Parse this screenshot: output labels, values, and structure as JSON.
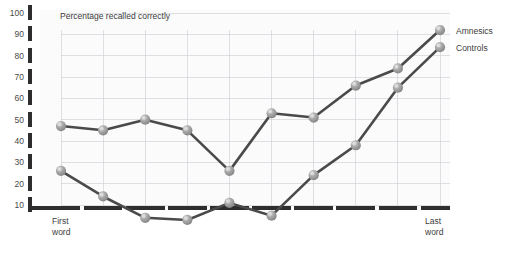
{
  "chart_data": {
    "type": "line",
    "title": "Percentage recalled correctly",
    "xlabel": "",
    "ylabel": "",
    "ylim": [
      0,
      100
    ],
    "yticks": [
      10,
      20,
      30,
      40,
      50,
      60,
      70,
      80,
      90,
      100
    ],
    "grid": true,
    "legend_position": "right",
    "x_first_label": "First\nword",
    "x_first_label_line1": "First",
    "x_first_label_line2": "word",
    "x_last_label_line1": "Last",
    "x_last_label_line2": "word",
    "x": [
      1,
      2,
      3,
      4,
      5,
      6,
      7,
      8,
      9,
      10
    ],
    "series": [
      {
        "name": "Amnesics",
        "values": [
          47,
          45,
          50,
          45,
          26,
          53,
          51,
          66,
          74,
          92
        ]
      },
      {
        "name": "Controls",
        "values": [
          26,
          14,
          4,
          3,
          11,
          5,
          24,
          38,
          65,
          84
        ]
      }
    ],
    "colors": {
      "line": "#4a4a4a",
      "marker_fill": "#9a9a9a",
      "marker_highlight": "#d6d6d6",
      "grid": "#c9cdd2",
      "axis": "#2e2e2e",
      "text": "#3c3c3c",
      "plot_background": "#fbfbfb"
    }
  },
  "legend": {
    "items": [
      {
        "label": "Amnesics"
      },
      {
        "label": "Controls"
      }
    ]
  },
  "axis": {
    "y_labels": [
      "100",
      "90",
      "80",
      "70",
      "60",
      "50",
      "40",
      "30",
      "20",
      "10"
    ],
    "x_left_line1": "First",
    "x_left_line2": "word",
    "x_right_line1": "Last",
    "x_right_line2": "word"
  },
  "title": {
    "text": "Percentage recalled correctly"
  }
}
